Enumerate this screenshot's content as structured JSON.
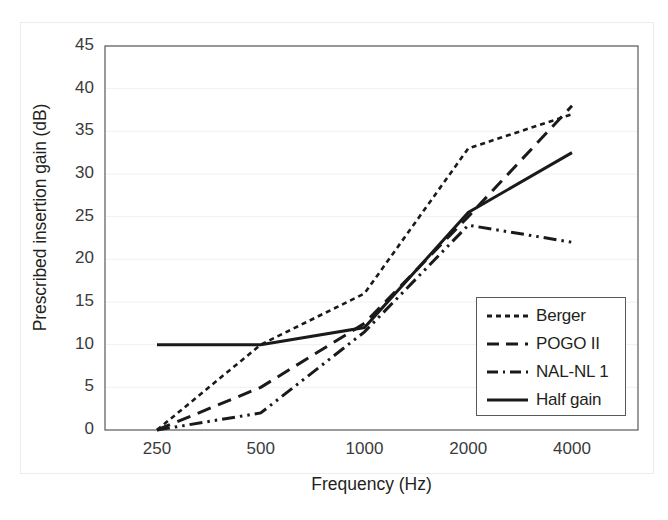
{
  "chart_data": {
    "type": "line",
    "title": "",
    "xlabel": "Frequency (Hz)",
    "ylabel": "Prescribed insertion gain (dB)",
    "categories": [
      "250",
      "500",
      "1000",
      "2000",
      "4000"
    ],
    "x_tick_labels": [
      "250",
      "500",
      "1000",
      "2000",
      "4000"
    ],
    "y_tick_labels": [
      "0",
      "5",
      "10",
      "15",
      "20",
      "25",
      "30",
      "35",
      "40",
      "45"
    ],
    "y_ticks": [
      0,
      5,
      10,
      15,
      20,
      25,
      30,
      35,
      40,
      45
    ],
    "ylim": [
      0,
      45
    ],
    "grid": true,
    "legend_position": "lower-right",
    "series": [
      {
        "name": "Berger",
        "values": [
          0,
          10,
          16,
          33,
          37
        ],
        "style": "dotted",
        "color": "#1a1a1a"
      },
      {
        "name": "POGO II",
        "values": [
          0,
          5,
          12.5,
          25,
          38
        ],
        "style": "dashed",
        "color": "#1a1a1a"
      },
      {
        "name": "NAL-NL 1",
        "values": [
          0,
          2,
          11.5,
          24,
          22
        ],
        "style": "dash-dot-dot",
        "color": "#1a1a1a"
      },
      {
        "name": "Half gain",
        "values": [
          10,
          10,
          12,
          25.5,
          32.5
        ],
        "style": "solid",
        "color": "#1a1a1a"
      }
    ]
  },
  "legend": {
    "items": [
      {
        "label": "Berger",
        "swatch": "dotted-line-swatch"
      },
      {
        "label": "POGO II",
        "swatch": "dashed-line-swatch"
      },
      {
        "label": "NAL-NL 1",
        "swatch": "dash-dot-dot-line-swatch"
      },
      {
        "label": "Half gain",
        "swatch": "solid-line-swatch"
      }
    ]
  },
  "axes": {
    "x_title": "Frequency (Hz)",
    "y_title": "Prescribed insertion gain (dB)"
  },
  "colors": {
    "line": "#1a1a1a",
    "axis": "#58595b",
    "grid": "#f0f0f0",
    "text": "#231f20",
    "tick_text": "#3b3b3b",
    "outer_frame": "#ececec"
  }
}
